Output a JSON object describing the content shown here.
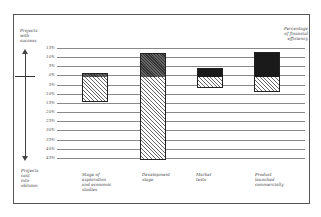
{
  "chart_data": {
    "type": "bar",
    "subtype": "diverging-stacked",
    "title": "",
    "left_axis_top_label": "Projects with success",
    "left_axis_bottom_label": "Projects cast into oblivion",
    "right_axis_label": "Percentage of financial efficiency",
    "tick_labels": [
      "15%",
      "10%",
      "5%",
      "0%",
      "5%",
      "10%",
      "15%",
      "20%",
      "25%",
      "30%",
      "35%",
      "40%",
      "45%"
    ],
    "zero_index": 3,
    "ylim_up": [
      0,
      15
    ],
    "ylim_down": [
      0,
      45
    ],
    "grid": true,
    "categories": [
      "Stage of exploration and economic studies",
      "Development stage",
      "Market tests",
      "Product launched commercially"
    ],
    "series": [
      {
        "name": "Projects with success (above 0%)",
        "values": [
          1.5,
          12.5,
          4.5,
          13
        ]
      },
      {
        "name": "Projects cast into oblivion (below 0%)",
        "values": [
          14,
          45,
          6.5,
          9
        ]
      }
    ],
    "success_fill": [
      "thin-hatch",
      "dark-hatch",
      "solid-black",
      "solid-black"
    ]
  },
  "labels": {
    "left_top": [
      "Projects",
      "with",
      "success"
    ],
    "left_bottom": [
      "Projects",
      "cast",
      "into",
      "oblivion"
    ],
    "right_top": [
      "Percentage",
      "of financial",
      "efficiency"
    ],
    "cat0": [
      "Stage of",
      "exploration",
      "and economic",
      "studies"
    ],
    "cat1": [
      "Development",
      "stage"
    ],
    "cat2": [
      "Market",
      "tests"
    ],
    "cat3": [
      "Product",
      "launched",
      "commercially"
    ]
  }
}
